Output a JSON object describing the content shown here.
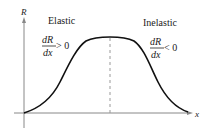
{
  "diagram": {
    "axes": {
      "y_label": "R",
      "x_label": "x"
    },
    "regions": [
      {
        "name": "Elastic",
        "derivative_num": "dR",
        "derivative_den": "dx",
        "inequality": "> 0"
      },
      {
        "name": "Inelastic",
        "derivative_num": "dR",
        "derivative_den": "dx",
        "inequality": "< 0"
      }
    ],
    "colors": {
      "curve": "#111111",
      "axes": "#888888",
      "dashed": "#999999",
      "text": "#222222"
    }
  }
}
